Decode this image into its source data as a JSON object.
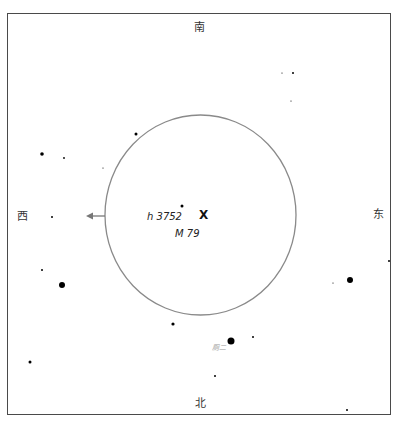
{
  "chart": {
    "directions": {
      "south": "南",
      "north": "北",
      "west": "西",
      "east": "东"
    },
    "target": {
      "name": "M 79",
      "marker": "X",
      "x": 203,
      "y": 216
    },
    "labels": [
      {
        "text": "h 3752",
        "x": 147,
        "y": 212,
        "color": "#222222",
        "size": 10
      },
      {
        "text": "M 79",
        "x": 175,
        "y": 229,
        "color": "#222222",
        "size": 10
      },
      {
        "text": "厕二",
        "x": 212,
        "y": 345,
        "color": "#999999",
        "size": 7
      }
    ],
    "field_circle": {
      "cx": 200.5,
      "cy": 215,
      "rx": 95.5,
      "ry": 100,
      "color": "#8a8a8a"
    },
    "direction_arrow": {
      "from_x": 105,
      "to_x": 86,
      "y": 216,
      "color": "#777777"
    },
    "stars": [
      {
        "x": 182,
        "y": 206,
        "r": 1.5
      },
      {
        "x": 136,
        "y": 134,
        "r": 1.5
      },
      {
        "x": 42,
        "y": 154,
        "r": 1.8
      },
      {
        "x": 64,
        "y": 158,
        "r": 0.9
      },
      {
        "x": 103,
        "y": 168,
        "r": 0.6
      },
      {
        "x": 52,
        "y": 217,
        "r": 1.0
      },
      {
        "x": 42,
        "y": 270,
        "r": 1.0
      },
      {
        "x": 62,
        "y": 285,
        "r": 3.0
      },
      {
        "x": 30,
        "y": 362,
        "r": 1.5
      },
      {
        "x": 282,
        "y": 73,
        "r": 0.6
      },
      {
        "x": 293,
        "y": 73,
        "r": 1.0
      },
      {
        "x": 291,
        "y": 101,
        "r": 0.6
      },
      {
        "x": 389,
        "y": 261,
        "r": 1.0
      },
      {
        "x": 350,
        "y": 280,
        "r": 3.0
      },
      {
        "x": 333,
        "y": 283,
        "r": 0.6
      },
      {
        "x": 173,
        "y": 324,
        "r": 1.6
      },
      {
        "x": 231,
        "y": 341,
        "r": 3.5
      },
      {
        "x": 253,
        "y": 337,
        "r": 1.0
      },
      {
        "x": 215,
        "y": 376,
        "r": 1.0
      },
      {
        "x": 347,
        "y": 410,
        "r": 1.0
      }
    ]
  }
}
